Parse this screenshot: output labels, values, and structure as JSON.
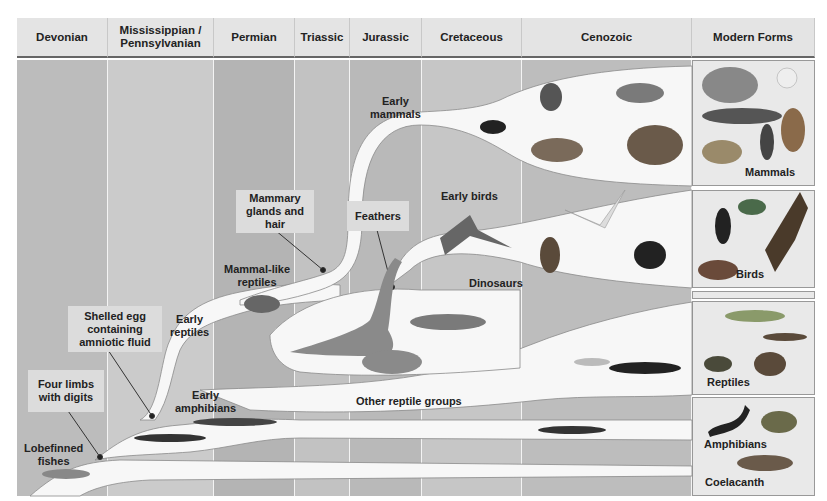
{
  "periods": [
    {
      "label": "Devonian",
      "left": 17,
      "width": 91,
      "fill": "#bcbcbc"
    },
    {
      "label": "Mississippian / Pennsylvanian",
      "left": 108,
      "width": 106,
      "fill": "#cbcbcb"
    },
    {
      "label": "Permian",
      "left": 214,
      "width": 81,
      "fill": "#b4b4b4"
    },
    {
      "label": "Triassic",
      "left": 295,
      "width": 55,
      "fill": "#c2c2c2"
    },
    {
      "label": "Jurassic",
      "left": 350,
      "width": 72,
      "fill": "#b9b9b9"
    },
    {
      "label": "Cretaceous",
      "left": 422,
      "width": 100,
      "fill": "#c6c6c6"
    },
    {
      "label": "Cenozoic",
      "left": 522,
      "width": 170,
      "fill": "#bdbdbd"
    }
  ],
  "modern_header": "Modern Forms",
  "lineage_labels": {
    "lobefinned_fishes": "Lobefinned\nfishes",
    "early_amphibians": "Early\namphibians",
    "early_reptiles": "Early\nreptiles",
    "mammal_like_reptiles": "Mammal-like\nreptiles",
    "early_mammals": "Early\nmammals",
    "early_birds": "Early birds",
    "dinosaurs": "Dinosaurs",
    "other_reptile_groups": "Other reptile groups"
  },
  "trait_callouts": {
    "four_limbs": "Four limbs\nwith digits",
    "shelled_egg": "Shelled egg\ncontaining\namniotic fluid",
    "mammary": "Mammary\nglands and\nhair",
    "feathers": "Feathers"
  },
  "modern_groups": [
    {
      "label": "Mammals",
      "animals": [
        "elephant",
        "rabbit",
        "whale",
        "deer",
        "human runner",
        "coyote"
      ]
    },
    {
      "label": "Birds",
      "animals": [
        "penguin",
        "parrots",
        "eagle",
        "pheasant"
      ]
    },
    {
      "label": "Reptiles",
      "animals": [
        "alligator",
        "lizard",
        "turtle",
        "snake"
      ]
    },
    {
      "label": "Amphibians",
      "animals": [
        "salamander",
        "frog"
      ]
    },
    {
      "label": "Coelacanth",
      "animals": [
        "coelacanth"
      ]
    }
  ],
  "colors": {
    "branch": "#f7f7f7",
    "header_bg": "#e4e4e4",
    "callout_bg": "#dcdcdc",
    "text": "#222222",
    "animal_dark": "#3a3a3a",
    "animal_mid": "#7a7a7a"
  }
}
